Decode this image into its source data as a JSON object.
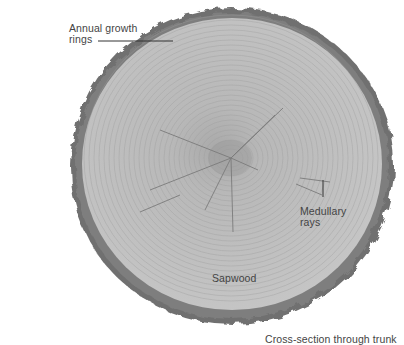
{
  "diagram": {
    "caption": "Cross-section through trunk",
    "labels": {
      "annual_rings_line1": "Annual growth",
      "annual_rings_line2": "rings",
      "medullary_line1": "Medullary",
      "medullary_line2": "rays",
      "sapwood": "Sapwood"
    },
    "colors": {
      "wood": "#bdbdbd",
      "rings": "#9a9a9a",
      "bark": "#6e6e6e",
      "heart": "#a8a8a8",
      "text": "#444444"
    }
  }
}
